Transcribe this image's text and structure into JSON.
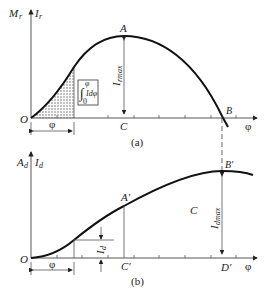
{
  "figure_a": {
    "y_label_left": "M",
    "y_label_left_sub": "r",
    "y_label_right": "I",
    "y_label_right_sub": "r",
    "x_label": "φ",
    "origin": "O",
    "peak_point": "A",
    "peak_foot": "C",
    "zero_point": "B",
    "peak_value_label": "I",
    "peak_value_sub": "rmax",
    "interval_label": "φ",
    "integral_box": {
      "upper": "φ",
      "lower": "0",
      "body": "Idφ"
    },
    "caption": "(a)"
  },
  "figure_b": {
    "y_label_left": "A",
    "y_label_left_sub": "d",
    "y_label_right": "I",
    "y_label_right_sub": "d",
    "x_label": "φ",
    "origin": "O",
    "point_a": "A'",
    "foot_a": "C'",
    "point_b": "B'",
    "foot_b": "D'",
    "region_label": "C",
    "max_value_label": "I",
    "max_value_sub": "dmax",
    "step_label": "I",
    "step_sub": "d",
    "interval_label": "φ",
    "caption": "(b)"
  }
}
